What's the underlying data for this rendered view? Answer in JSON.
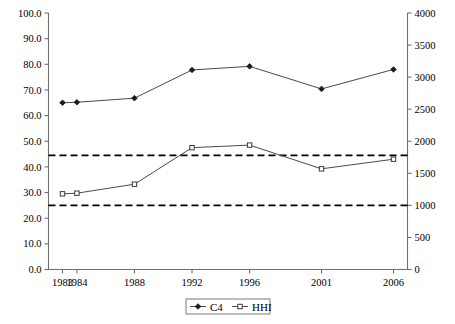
{
  "chart_data": {
    "type": "line",
    "title": "",
    "subtitle": "",
    "xlabel": "",
    "ylabel": "",
    "y2label": "",
    "grid": false,
    "legend_position": "bottom-center",
    "categories": [
      "1983",
      "1984",
      "1988",
      "1992",
      "1996",
      "2001",
      "2006"
    ],
    "series": [
      {
        "name": "C4",
        "axis": "left",
        "marker": "filled-diamond",
        "values": [
          65.0,
          65.2,
          66.8,
          77.8,
          79.2,
          70.4,
          78.0
        ]
      },
      {
        "name": "HHI",
        "axis": "right",
        "marker": "open-square",
        "values": [
          1180,
          1190,
          1330,
          1900,
          1940,
          1570,
          1720
        ]
      }
    ],
    "reference_lines": [
      {
        "name": "upper-threshold",
        "left_value": 44.5,
        "right_value": 1800,
        "style": "dashed"
      },
      {
        "name": "lower-threshold",
        "left_value": 25.0,
        "right_value": 1000,
        "style": "dashed"
      }
    ],
    "left_axis": {
      "min": 0.0,
      "max": 100.0,
      "step": 10.0,
      "ticks": [
        "0.0",
        "10.0",
        "20.0",
        "30.0",
        "40.0",
        "50.0",
        "60.0",
        "70.0",
        "80.0",
        "90.0",
        "100.0"
      ]
    },
    "right_axis": {
      "min": 0,
      "max": 4000,
      "step": 500,
      "ticks": [
        "0",
        "500",
        "1000",
        "1500",
        "2000",
        "2500",
        "3000",
        "3500",
        "4000"
      ]
    },
    "legend": [
      {
        "label": "C4",
        "marker": "filled-diamond"
      },
      {
        "label": "HHI",
        "marker": "open-square"
      }
    ],
    "colors": {
      "series_line": "#4a4a4a",
      "axis": "#6f6f6f",
      "reference_line": "#000000",
      "background": "#ffffff",
      "text": "#000000"
    }
  }
}
